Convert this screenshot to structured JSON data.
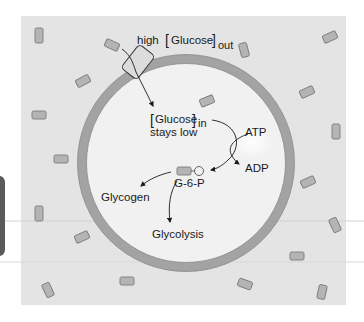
{
  "diagram": {
    "outside_label": {
      "prefix": "high",
      "species": "Glucose",
      "subscript": "out"
    },
    "inside_label": {
      "species": "Glucose",
      "subscript": "in",
      "line2": "stays low"
    },
    "atp_label": "ATP",
    "adp_label": "ADP",
    "g6p_label": "G-6-P",
    "glycogen_label": "Glycogen",
    "glycolysis_label": "Glycolysis",
    "colors": {
      "panel": "#e4e4e4",
      "cell_interior": "#f0f0f0",
      "membrane": "#a3a3a3",
      "molecule_fill": "#b4b4b4",
      "molecule_stroke": "#7a7a7a",
      "arrow": "#1a1a1a",
      "side_tab": "#5a5a5a"
    }
  }
}
